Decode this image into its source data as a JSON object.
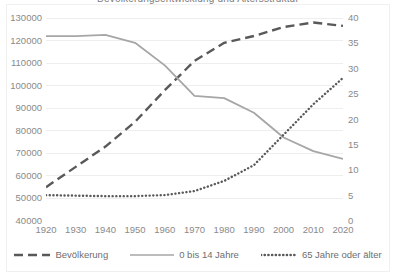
{
  "chart_data": {
    "type": "line",
    "title": "Bevölkerungsentwicklung und Altersstruktur",
    "xlabel": "",
    "ylabel": "",
    "grid": true,
    "legend_position": "bottom",
    "x": [
      1920,
      1930,
      1940,
      1950,
      1960,
      1970,
      1980,
      1990,
      2000,
      2010,
      2020
    ],
    "x_tick_labels": [
      "1920",
      "1930",
      "1940",
      "1950",
      "1960",
      "1970",
      "1980",
      "1990",
      "2000",
      "2010",
      "2020"
    ],
    "axes": {
      "left": {
        "min": 40000,
        "max": 130000,
        "step": 10000,
        "tick_labels": [
          "130000",
          "120000",
          "110000",
          "100000",
          "90000",
          "80000",
          "70000",
          "60000",
          "50000",
          "40000"
        ]
      },
      "right": {
        "min": 0,
        "max": 40,
        "step": 5,
        "tick_labels": [
          "40",
          "35",
          "30",
          "25",
          "20",
          "15",
          "10",
          "5",
          "0"
        ]
      }
    },
    "series": [
      {
        "name": "Bevölkerung",
        "axis": "left",
        "style": "dashed",
        "color": "#595959",
        "values": [
          55000,
          64000,
          73000,
          84000,
          98000,
          111000,
          119000,
          122000,
          126000,
          128000,
          126500
        ]
      },
      {
        "name": "0 bis 14 Jahre",
        "axis": "left",
        "style": "solid",
        "color": "#a6a6a6",
        "values": [
          122000,
          122000,
          122500,
          119000,
          109000,
          95500,
          94500,
          88000,
          77000,
          71000,
          67500
        ]
      },
      {
        "name": "65 Jahre oder älter",
        "axis": "right",
        "style": "dotted",
        "color": "#595959",
        "values": [
          5.1,
          5.0,
          4.9,
          4.9,
          5.1,
          5.9,
          7.9,
          11.0,
          17.0,
          23.0,
          28.2
        ]
      }
    ]
  },
  "legend": {
    "items": [
      {
        "label": "Bevölkerung",
        "style": "dashed"
      },
      {
        "label": "0 bis 14 Jahre",
        "style": "solid"
      },
      {
        "label": "65 Jahre oder älter",
        "style": "dotted"
      }
    ]
  }
}
